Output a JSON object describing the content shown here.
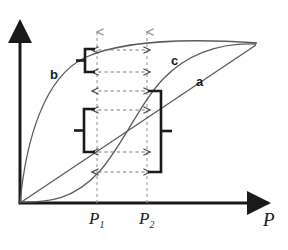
{
  "figure": {
    "type": "diagram",
    "axis": {
      "x_label": "P",
      "y_label": "",
      "x_arrow": true,
      "y_arrow": true,
      "origin": [
        20,
        203
      ],
      "x_end": [
        272,
        203
      ],
      "y_end": [
        20,
        18
      ]
    },
    "tick_labels": [
      {
        "name": "P1",
        "text": "P",
        "sub": "1",
        "x": 97,
        "y": 212
      },
      {
        "name": "P2",
        "text": "P",
        "sub": "2",
        "x": 147,
        "y": 212
      }
    ],
    "curve_labels": [
      {
        "name": "a",
        "text": "a",
        "x": 196,
        "y": 80
      },
      {
        "name": "b",
        "text": "b",
        "x": 50,
        "y": 75
      },
      {
        "name": "c",
        "text": "c",
        "x": 172,
        "y": 61
      }
    ],
    "curves": [
      {
        "name": "a",
        "shape": "linear",
        "path": "M20,203 L255,45"
      },
      {
        "name": "b",
        "shape": "saturating",
        "path": "M20,203 C30,120 60,62 110,50 C160,40 215,40 257,43"
      },
      {
        "name": "c",
        "shape": "sigmoid",
        "path": "M20,202 C55,202 75,198 100,170 C125,142 140,100 165,75 C195,47 230,43 256,44"
      }
    ],
    "vertical_guides": [
      {
        "name": "P1-guide",
        "x": 97,
        "y_top": 30,
        "y_bottom": 203
      },
      {
        "name": "P2-guide",
        "x": 147,
        "y_top": 30,
        "y_bottom": 203
      }
    ],
    "measure_arrows": [
      {
        "name": "arrow-b-upper",
        "y": 50,
        "x1": 91,
        "x2": 150
      },
      {
        "name": "arrow-b-lower",
        "y": 72,
        "x1": 91,
        "x2": 150
      },
      {
        "name": "arrow-c-upper",
        "y": 91,
        "x1": 91,
        "x2": 150
      },
      {
        "name": "arrow-a-upper",
        "y": 110,
        "x1": 91,
        "x2": 150
      },
      {
        "name": "arrow-a-lower",
        "y": 152,
        "x1": 91,
        "x2": 150
      },
      {
        "name": "arrow-c-lower",
        "y": 172,
        "x1": 91,
        "x2": 150
      }
    ],
    "brackets": [
      {
        "name": "bracket-b-range",
        "side": "left",
        "x": 82,
        "y_top": 50,
        "y_bottom": 72
      },
      {
        "name": "bracket-a-range",
        "side": "left",
        "x": 80,
        "y_top": 110,
        "y_bottom": 152
      },
      {
        "name": "bracket-c-range",
        "side": "right",
        "x": 163,
        "y_top": 91,
        "y_bottom": 172
      }
    ],
    "colors": {
      "ink": "#1a1a1a",
      "curve": "#5a5a5a",
      "dash": "#9a9a9a",
      "background": "#ffffff"
    }
  }
}
